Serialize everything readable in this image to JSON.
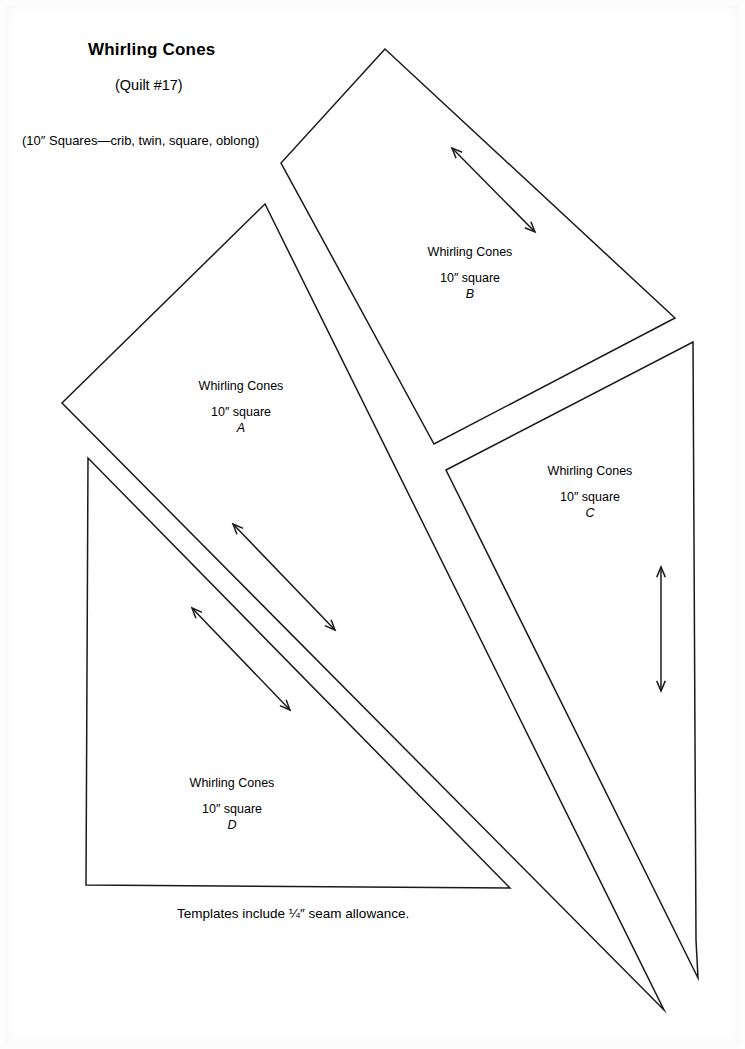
{
  "sheet": {
    "title": "Whirling Cones",
    "subtitle": "(Quilt #17)",
    "size_note": "(10″ Squares—crib, twin, square, oblong)",
    "seam_note": "Templates include ¼″ seam allowance.",
    "ink_color": "#1a1a1a",
    "paper_color": "#ffffff"
  },
  "pieces": [
    {
      "id": "A",
      "name": "Whirling Cones",
      "size": "10″ square",
      "letter": "A",
      "shape": "triangle",
      "points": "265,204 62,403 664,1010",
      "faint": false
    },
    {
      "id": "B",
      "name": "Whirling Cones",
      "size": "10″ square",
      "letter": "B",
      "shape": "quadrilateral",
      "points": "385,49 281,163 434,444 675,318",
      "faint": false
    },
    {
      "id": "C",
      "name": "Whirling Cones",
      "size": "10″ square",
      "letter": "C",
      "shape": "quadrilateral",
      "points": "446,470 693,342 696,940 698,978",
      "faint": false
    },
    {
      "id": "D",
      "name": "Whirling Cones",
      "size": "10″ square",
      "letter": "D",
      "shape": "triangle",
      "points": "88,458 86,885 510,888",
      "faint": false
    }
  ],
  "grain_arrows": [
    {
      "id": "grain-b",
      "x1": 535,
      "y1": 232,
      "x2": 452,
      "y2": 148
    },
    {
      "id": "grain-d1",
      "x1": 335,
      "y1": 630,
      "x2": 233,
      "y2": 524
    },
    {
      "id": "grain-d2",
      "x1": 290,
      "y1": 710,
      "x2": 192,
      "y2": 608
    },
    {
      "id": "grain-c",
      "x1": 661,
      "y1": 691,
      "x2": 661,
      "y2": 567
    }
  ]
}
